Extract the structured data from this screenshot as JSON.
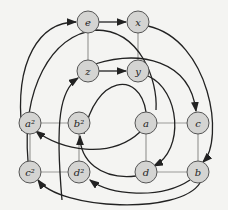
{
  "diagram": {
    "nodes": [
      {
        "id": "e",
        "label": "e",
        "x": 88,
        "y": 22
      },
      {
        "id": "x",
        "label": "x",
        "x": 138,
        "y": 22
      },
      {
        "id": "z",
        "label": "z",
        "x": 88,
        "y": 71
      },
      {
        "id": "y",
        "label": "y",
        "x": 138,
        "y": 71
      },
      {
        "id": "a2",
        "label": "a²",
        "x": 30,
        "y": 123
      },
      {
        "id": "b2",
        "label": "b²",
        "x": 79,
        "y": 123
      },
      {
        "id": "a",
        "label": "a",
        "x": 146,
        "y": 123
      },
      {
        "id": "c",
        "label": "c",
        "x": 198,
        "y": 123
      },
      {
        "id": "c2",
        "label": "c²",
        "x": 30,
        "y": 172
      },
      {
        "id": "d2",
        "label": "d²",
        "x": 79,
        "y": 172
      },
      {
        "id": "d",
        "label": "d",
        "x": 146,
        "y": 172
      },
      {
        "id": "b",
        "label": "b",
        "x": 198,
        "y": 172
      }
    ],
    "grey_edges": [
      [
        "e",
        "z"
      ],
      [
        "x",
        "y"
      ],
      [
        "a2",
        "b2"
      ],
      [
        "a2",
        "c2"
      ],
      [
        "c2",
        "d2"
      ],
      [
        "b2",
        "d2"
      ],
      [
        "a",
        "c"
      ],
      [
        "a",
        "d"
      ],
      [
        "d",
        "b"
      ],
      [
        "c",
        "b"
      ]
    ],
    "arrow_edges": [
      [
        "e",
        "x"
      ],
      [
        "z",
        "y"
      ]
    ]
  }
}
